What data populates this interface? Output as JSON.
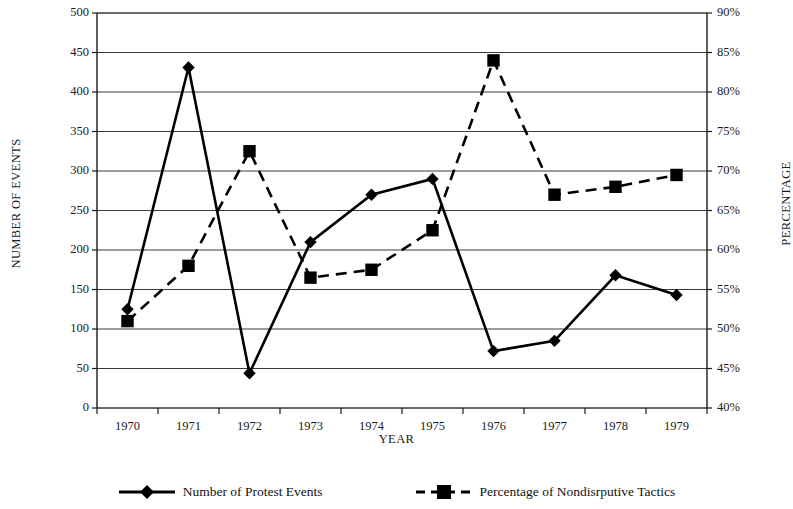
{
  "chart_data": {
    "type": "line",
    "title": "",
    "xlabel": "YEAR",
    "ylabel": "NUMBER OF EVENTS",
    "y2label": "PERCENTAGE",
    "categories": [
      "1970",
      "1971",
      "1972",
      "1973",
      "1974",
      "1975",
      "1976",
      "1977",
      "1978",
      "1979"
    ],
    "x": [
      1970,
      1971,
      1972,
      1973,
      1974,
      1975,
      1976,
      1977,
      1978,
      1979
    ],
    "ylim": [
      0,
      500
    ],
    "ytick_step": 50,
    "yticks": [
      "0",
      "50",
      "100",
      "150",
      "200",
      "250",
      "300",
      "350",
      "400",
      "450",
      "500"
    ],
    "y2lim": [
      40,
      90
    ],
    "y2tick_step": 5,
    "y2ticks": [
      "40%",
      "45%",
      "50%",
      "55%",
      "60%",
      "65%",
      "70%",
      "75%",
      "80%",
      "85%",
      "90%"
    ],
    "grid": true,
    "legend_position": "bottom",
    "series": [
      {
        "name": "Number of Protest Events",
        "axis": "left",
        "marker": "diamond",
        "line_style": "solid",
        "color": "#000000",
        "values": [
          125,
          431,
          44,
          210,
          270,
          290,
          72,
          85,
          168,
          143
        ]
      },
      {
        "name": "Percentage of Nondisrputive Tactics",
        "axis": "right",
        "marker": "square",
        "line_style": "dashed",
        "color": "#000000",
        "values": [
          51.0,
          58.0,
          72.5,
          56.5,
          57.5,
          62.5,
          84.0,
          67.0,
          68.0,
          69.5
        ]
      }
    ]
  },
  "legend": {
    "items": [
      {
        "label": "Number of Protest Events",
        "marker": "diamond-icon",
        "style": "solid"
      },
      {
        "label": "Percentage of Nondisrputive Tactics",
        "marker": "square-icon",
        "style": "dashed"
      }
    ]
  }
}
